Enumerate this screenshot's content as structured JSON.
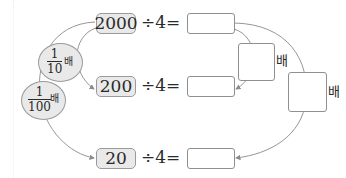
{
  "rows": [
    {
      "value": "2000",
      "operation": "÷4=",
      "answer": ""
    },
    {
      "value": "200",
      "operation": "÷4=",
      "answer": ""
    },
    {
      "value": "20",
      "operation": "÷4=",
      "answer": ""
    }
  ],
  "left_multipliers": [
    {
      "numerator": "1",
      "denominator": "10",
      "unit": "배"
    },
    {
      "numerator": "1",
      "denominator": "100",
      "unit": "배"
    }
  ],
  "right_multipliers": [
    {
      "answer": "",
      "unit": "배"
    },
    {
      "answer": "",
      "unit": "배"
    }
  ],
  "colors": {
    "box_fill": "#e9e9e9",
    "box_border": "#9a9a9a",
    "line": "#8a8a8a",
    "text": "#2a2a2a"
  }
}
